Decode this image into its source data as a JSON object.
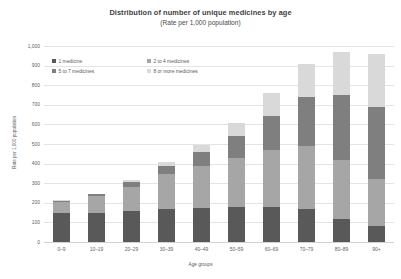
{
  "chart_data": {
    "type": "bar",
    "subtype": "stacked-bar",
    "title": "Distribution of number of unique medicines by age",
    "subtitle": "(Rate per 1,000 population)",
    "xlabel": "Age groups",
    "ylabel": "Rate per 1,000 population",
    "ylim": [
      0,
      1000
    ],
    "yticks": [
      0,
      100,
      200,
      300,
      400,
      500,
      600,
      700,
      800,
      900,
      1000
    ],
    "ytick_labels": [
      "0",
      "100",
      "200",
      "300",
      "400",
      "500",
      "600",
      "700",
      "800",
      "900",
      "1,000"
    ],
    "grid": true,
    "legend_position": "upper-left-inside",
    "categories": [
      "0–9",
      "10–19",
      "20–29",
      "30–39",
      "40–49",
      "50–59",
      "60–69",
      "70–79",
      "80–89",
      "90+"
    ],
    "series": [
      {
        "name": "1 medicine",
        "color": "#595959",
        "values": [
          148,
          150,
          158,
          168,
          175,
          178,
          180,
          170,
          118,
          80
        ]
      },
      {
        "name": "2 to 4 medicines",
        "color": "#a6a6a6",
        "values": [
          58,
          85,
          125,
          178,
          215,
          252,
          290,
          320,
          300,
          240
        ]
      },
      {
        "name": "5 to 7 medicines",
        "color": "#7f7f7f",
        "values": [
          4,
          8,
          22,
          42,
          68,
          112,
          175,
          250,
          330,
          370
        ]
      },
      {
        "name": "8 or more medicines",
        "color": "#d9d9d9",
        "values": [
          2,
          4,
          10,
          20,
          35,
          63,
          115,
          170,
          222,
          270
        ]
      }
    ],
    "totals": [
      212,
      247,
      315,
      408,
      493,
      605,
      760,
      910,
      970,
      960
    ]
  }
}
